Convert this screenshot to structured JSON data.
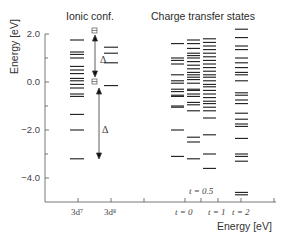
{
  "figure": {
    "column_titles": {
      "ionic": "Ionic conf.",
      "charge_transfer": "Charge transfer states"
    },
    "y_axis": {
      "title": "Energy [eV]",
      "ticks": [
        "2.0",
        "0.0",
        "−2.0",
        "−4.0"
      ]
    },
    "x_axis": {
      "title": "Energy [eV]",
      "labels": {
        "d7": "3d⁷",
        "d8": "3d⁸",
        "t0": "t = 0",
        "t05": "t = 0.5",
        "t1": "t = 1",
        "t2": "t = 2"
      }
    },
    "annotations": {
      "delta": "Δ",
      "symbol": "⊟"
    }
  },
  "chart_data": {
    "type": "energy-level diagram",
    "title": "",
    "ylabel": "Energy [eV]",
    "xlabel": "Energy [eV]",
    "ylim": [
      -5.0,
      2.0
    ],
    "yticks": [
      2.0,
      0.0,
      -2.0,
      -4.0
    ],
    "columns": [
      {
        "name": "3d7",
        "group": "Ionic conf.",
        "levels": [
          1.75,
          1.25,
          1.15,
          1.0,
          0.65,
          0.5,
          0.35,
          0.15,
          0.05,
          -0.1,
          -0.25,
          -0.5,
          -0.6,
          -1.35,
          -2.0,
          -3.2
        ]
      },
      {
        "name": "3d8",
        "group": "Ionic conf.",
        "levels": [
          1.45,
          1.2,
          0.8,
          -0.15
        ]
      },
      {
        "name": "t = 0",
        "group": "Charge transfer states",
        "levels": [
          1.6,
          1.0,
          0.9,
          0.75,
          0.3,
          0.05,
          -0.05,
          -0.3,
          -0.4,
          -0.55,
          -0.6,
          -1.0,
          -1.05,
          -2.0,
          -3.1
        ]
      },
      {
        "name": "t = 0.5",
        "group": "Charge transfer states",
        "levels": [
          1.75,
          1.6,
          1.4,
          1.2,
          1.1,
          1.0,
          0.85,
          0.7,
          0.55,
          0.4,
          0.3,
          0.2,
          0.1,
          -0.05,
          -0.3,
          -0.35,
          -0.5,
          -0.6,
          -0.85,
          -0.95,
          -1.2,
          -2.3,
          -2.5,
          -3.2
        ]
      },
      {
        "name": "t = 1",
        "group": "Charge transfer states",
        "levels": [
          1.8,
          1.65,
          1.5,
          1.35,
          1.2,
          1.05,
          0.9,
          0.75,
          0.6,
          0.45,
          0.3,
          0.2,
          0.05,
          -0.1,
          -0.2,
          -0.35,
          -0.5,
          -0.65,
          -0.8,
          -0.9,
          -1.05,
          -1.2,
          -1.5,
          -2.2,
          -3.0,
          -3.6
        ]
      },
      {
        "name": "t = 2",
        "group": "Charge transfer states",
        "levels": [
          2.2,
          1.85,
          1.5,
          1.35,
          1.0,
          0.8,
          0.6,
          0.4,
          0.3,
          0.05,
          -0.45,
          -0.55,
          -0.75,
          -0.9,
          -1.3,
          -1.55,
          -1.75,
          -1.85,
          -2.35,
          -3.0,
          -3.1,
          -3.3,
          -4.6,
          -4.7
        ]
      }
    ],
    "annotations": [
      {
        "text": "Δ",
        "from": 1.9,
        "to": 0.05,
        "x_between": "3d7-3d8"
      },
      {
        "text": "Δ",
        "from": -0.25,
        "to": -3.2,
        "x_between": "3d7-3d8"
      }
    ]
  }
}
